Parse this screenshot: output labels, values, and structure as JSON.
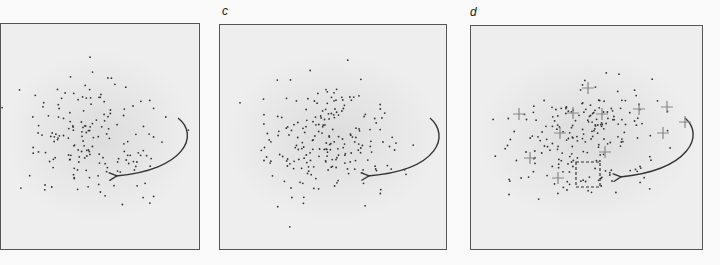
{
  "panels": [
    {
      "id": "b",
      "label": "",
      "x": 0,
      "y": 23,
      "w": 200,
      "h": 227,
      "arrow": "from upper-right curving to center-right",
      "annotations": "points only"
    },
    {
      "id": "c",
      "label": "c",
      "x": 219,
      "y": 24,
      "w": 228,
      "h": 226,
      "arrow": "from upper-right curving to center-right",
      "annotations": "points with denser clustering"
    },
    {
      "id": "d",
      "label": "d",
      "x": 470,
      "y": 25,
      "w": 233,
      "h": 225,
      "arrow": "from upper-right curving to dashed square",
      "annotations": "points with cross markers and dashed selection box"
    }
  ],
  "colors": {
    "background": "#fafafa",
    "panel_fill": "#e8e8e8",
    "border": "#555555",
    "dot": "#333333",
    "cross": "#888888",
    "arrow": "#333333"
  }
}
